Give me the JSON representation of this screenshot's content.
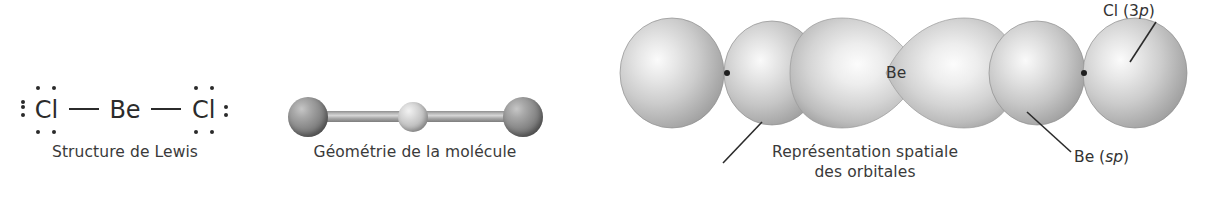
{
  "figure": {
    "background_color": "#ffffff",
    "text_color": "#3a3a3a"
  },
  "lewis": {
    "caption": "Structure de Lewis",
    "left_atom": "Cl",
    "center_atom": "Be",
    "right_atom": "Cl",
    "bond_symbol": "—",
    "lone_pairs_per_chlorine": 3,
    "dot_color": "#2b2b2b"
  },
  "geometry": {
    "caption": "Géométrie de la molécule",
    "shape": "linéaire",
    "atoms": [
      {
        "element": "Cl",
        "role": "terminal",
        "color": "#8b8b8b"
      },
      {
        "element": "Be",
        "role": "central",
        "color": "#dcdcdc"
      },
      {
        "element": "Cl",
        "role": "terminal",
        "color": "#8b8b8b"
      }
    ],
    "bond_color": "#b9b9b9"
  },
  "orbitals": {
    "caption_line1": "Représentation spatiale",
    "caption_line2": "des orbitales",
    "center_label": "Be",
    "chlorine_orbital_label": "Cl (3p)",
    "chlorine_orbital_label_italic": "p",
    "beryllium_orbital_label": "Be (sp)",
    "beryllium_orbital_label_italic": "sp",
    "lobe_fill_light": "#f4f4f4",
    "lobe_fill_mid": "#c4c4c4",
    "lobe_fill_dark": "#9a9a9a",
    "node_dot_color": "#1f1f1f",
    "leader_line_color": "#2b2b2b"
  },
  "bottom_strip": {
    "text": ""
  }
}
